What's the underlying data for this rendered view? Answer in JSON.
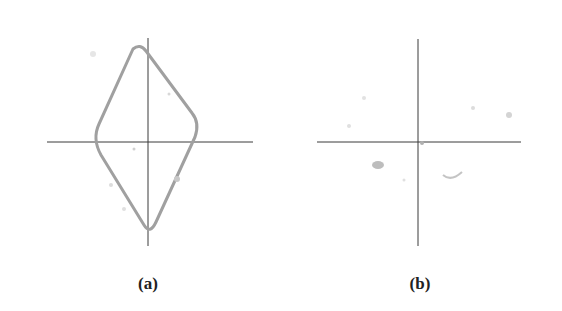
{
  "figure": {
    "panels": [
      {
        "id": "a",
        "label": "(a)",
        "content": "diamond-shaped outline visible in circular field of view with crosshair"
      },
      {
        "id": "b",
        "label": "(b)",
        "content": "empty circular field of view with crosshair and faint debris"
      }
    ],
    "colors": {
      "ring_dark": "#1a1a1a",
      "field": "#ffffff",
      "outline": "#9a9a9a",
      "crosshair": "#3a3a3a"
    }
  }
}
